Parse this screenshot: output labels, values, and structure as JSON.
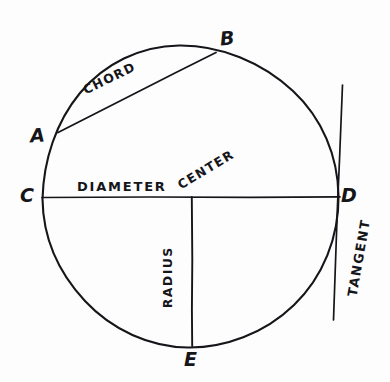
{
  "figure": {
    "kind": "hand-drawn-geometry-diagram",
    "background_color": "#fdfdfd",
    "ink_color": "#15151a"
  },
  "points": [
    {
      "id": "A",
      "label": "A",
      "x": 58,
      "y": 132,
      "role": "chord-endpoint-on-circle"
    },
    {
      "id": "B",
      "label": "B",
      "x": 215,
      "y": 53,
      "role": "chord-endpoint-on-circle"
    },
    {
      "id": "C",
      "label": "C",
      "x": 42,
      "y": 197,
      "role": "diameter-endpoint-on-circle"
    },
    {
      "id": "D",
      "label": "D",
      "x": 338,
      "y": 197,
      "role": "diameter-endpoint-and-tangent-point"
    },
    {
      "id": "E",
      "label": "E",
      "x": 192,
      "y": 346,
      "role": "radius-endpoint-on-circle"
    }
  ],
  "terms": [
    {
      "id": "chord",
      "label": "CHORD",
      "rotation_deg": -26
    },
    {
      "id": "diameter",
      "label": "DIAMETER",
      "rotation_deg": 0
    },
    {
      "id": "center",
      "label": "CENTER",
      "rotation_deg": -31
    },
    {
      "id": "radius",
      "label": "RADIUS",
      "rotation_deg": -90
    },
    {
      "id": "tangent",
      "label": "TANGENT",
      "rotation_deg": -80
    }
  ],
  "geometry": {
    "circle": {
      "cx": 190,
      "cy": 197,
      "rx": 148,
      "ry": 151
    },
    "center_point": {
      "x": 192,
      "y": 197
    },
    "chord_line": {
      "x1": 58,
      "y1": 132,
      "x2": 216,
      "y2": 52
    },
    "diameter_line": {
      "x1": 42,
      "y1": 197,
      "x2": 340,
      "y2": 197
    },
    "radius_line": {
      "x1": 192,
      "y1": 197,
      "x2": 192,
      "y2": 346
    },
    "tangent_line": {
      "x1": 342,
      "y1": 85,
      "x2": 333,
      "y2": 320
    }
  }
}
